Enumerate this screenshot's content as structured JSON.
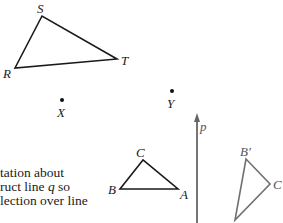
{
  "figure": {
    "triangle_RST": {
      "vertices": {
        "S": [
          42,
          16
        ],
        "R": [
          15,
          68
        ],
        "T": [
          117,
          59
        ]
      },
      "labels": {
        "S": "S",
        "R": "R",
        "T": "T"
      },
      "stroke": "#1a1a1a"
    },
    "points": {
      "X": {
        "pos": [
          62,
          100
        ],
        "label": "X"
      },
      "Y": {
        "pos": [
          172,
          91
        ],
        "label": "Y"
      }
    },
    "line_p": {
      "x": 197,
      "y_top": 113,
      "y_bottom": 223,
      "label": "p",
      "stroke": "#666666"
    },
    "triangle_ABC": {
      "vertices": {
        "C": [
          143,
          160
        ],
        "B": [
          120,
          189
        ],
        "A": [
          178,
          189
        ]
      },
      "labels": {
        "C": "C",
        "B": "B",
        "A": "A"
      },
      "stroke": "#1a1a1a"
    },
    "triangle_image": {
      "vertices": {
        "B_prime": [
          246,
          159
        ],
        "C_prime": [
          270,
          184
        ],
        "A_prime": [
          235,
          220
        ]
      },
      "labels": {
        "B_prime": "B′",
        "C_prime": "C"
      },
      "stroke": "#707070"
    }
  },
  "text": {
    "line1": "tation about",
    "line2_pre": "ruct line ",
    "line2_var": "q",
    "line2_post": " so",
    "line3": "lection over line"
  }
}
